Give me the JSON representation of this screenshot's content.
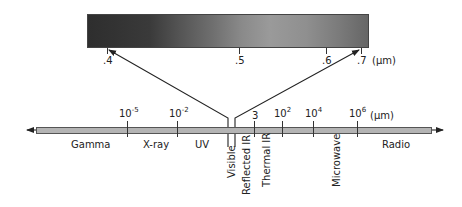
{
  "diagram": {
    "visible_band": {
      "ticks": [
        {
          "label": ".4",
          "x": 107
        },
        {
          "label": ".5",
          "x": 239
        },
        {
          "label": ".6",
          "x": 326
        },
        {
          "label": ".7",
          "x": 361
        }
      ],
      "unit": "(µm)"
    },
    "spectrum": {
      "ticks": [
        {
          "base": "10",
          "exp": "-5",
          "x": 127
        },
        {
          "base": "10",
          "exp": "-2",
          "x": 177
        },
        {
          "base": "3",
          "exp": "",
          "x": 254
        },
        {
          "base": "10",
          "exp": "2",
          "x": 282
        },
        {
          "base": "10",
          "exp": "4",
          "x": 313
        },
        {
          "base": "10",
          "exp": "6",
          "x": 357
        }
      ],
      "unit": "(µm)",
      "regions_horizontal": [
        {
          "label": "Gamma",
          "x": 71
        },
        {
          "label": "X-ray",
          "x": 143
        },
        {
          "label": "UV",
          "x": 195
        },
        {
          "label": "Radio",
          "x": 382
        }
      ],
      "regions_vertical": [
        {
          "label": "Visible",
          "x": 228
        },
        {
          "label": "Reflected IR",
          "x": 242
        },
        {
          "label": "Thermal IR",
          "x": 262
        },
        {
          "label": "Microwave",
          "x": 331
        }
      ]
    },
    "colors": {
      "line": "#222222",
      "bar_fill": "#b4b4b4"
    }
  }
}
